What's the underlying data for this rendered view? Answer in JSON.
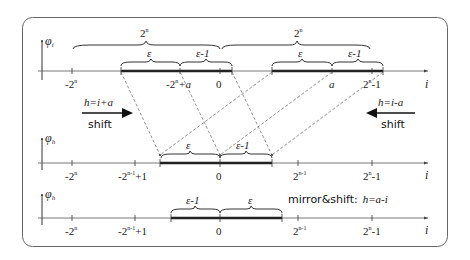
{
  "figure": {
    "frame": {
      "stroke": "#555555",
      "background": "#ffffff"
    }
  },
  "axes": [
    {
      "id": "phi_i",
      "y_label": "φ",
      "y_label_sub": "i",
      "x_label": "i",
      "ticks": [
        {
          "label": "-2",
          "sup": "n",
          "suffix": ""
        },
        {
          "label": "-2",
          "sup": "n",
          "suffix": "+a"
        },
        {
          "label": "0",
          "sup": "",
          "suffix": ""
        },
        {
          "label": "a",
          "sup": "",
          "suffix": ""
        },
        {
          "label": "2",
          "sup": "n",
          "suffix": "-1"
        }
      ],
      "big_braces": [
        {
          "label": "2",
          "sup": "n"
        },
        {
          "label": "2",
          "sup": "n"
        }
      ],
      "segments": [
        {
          "left_label": "ε",
          "right_label": "ε-1"
        },
        {
          "left_label": "ε",
          "right_label": "ε-1"
        }
      ]
    },
    {
      "id": "phi_h_shift",
      "y_label": "φ",
      "y_label_sub": "h",
      "x_label": "i",
      "ticks": [
        {
          "label": "-2",
          "sup": "n",
          "suffix": ""
        },
        {
          "label": "-2",
          "sup": "n-1",
          "suffix": "+1"
        },
        {
          "label": "0",
          "sup": "",
          "suffix": ""
        },
        {
          "label": "2",
          "sup": "n-1",
          "suffix": ""
        },
        {
          "label": "2",
          "sup": "n",
          "suffix": "-1"
        }
      ],
      "segments": [
        {
          "left_label": "ε",
          "right_label": "ε-1"
        }
      ]
    },
    {
      "id": "phi_h_mirror",
      "y_label": "φ",
      "y_label_sub": "h",
      "x_label": "i",
      "ticks": [
        {
          "label": "-2",
          "sup": "n",
          "suffix": ""
        },
        {
          "label": "-2",
          "sup": "n-1",
          "suffix": "+1"
        },
        {
          "label": "0",
          "sup": "",
          "suffix": ""
        },
        {
          "label": "2",
          "sup": "n-1",
          "suffix": ""
        },
        {
          "label": "2",
          "sup": "n",
          "suffix": "-1"
        }
      ],
      "segments": [
        {
          "left_label": "ε-1",
          "right_label": "ε"
        }
      ]
    }
  ],
  "annotations": {
    "left_shift": {
      "formula": "h=i+a",
      "word": "shift",
      "direction": "right"
    },
    "right_shift": {
      "formula": "h=i-a",
      "word": "shift",
      "direction": "left"
    },
    "mirror": {
      "prefix": "mirror&shift:",
      "formula": "h=a-i"
    }
  }
}
